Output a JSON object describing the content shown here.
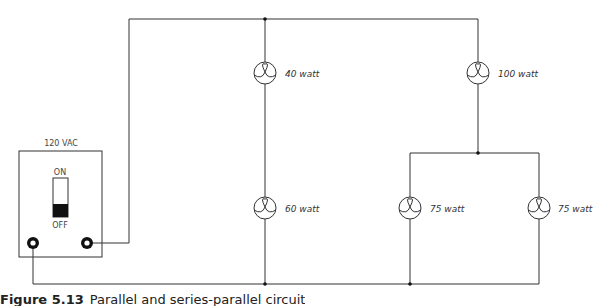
{
  "source": {
    "label": "120 VAC",
    "switch_on": "ON",
    "switch_off": "OFF",
    "switch_state": "OFF"
  },
  "bulbs": [
    {
      "label": "40 watt"
    },
    {
      "label": "60 watt"
    },
    {
      "label": "100 watt"
    },
    {
      "label": "75 watt"
    },
    {
      "label": "75 watt"
    }
  ],
  "caption": {
    "figure": "Figure 5.13",
    "text": "Parallel and series-parallel circuit"
  },
  "colors": {
    "wire": "#333333",
    "background": "#ffffff"
  }
}
